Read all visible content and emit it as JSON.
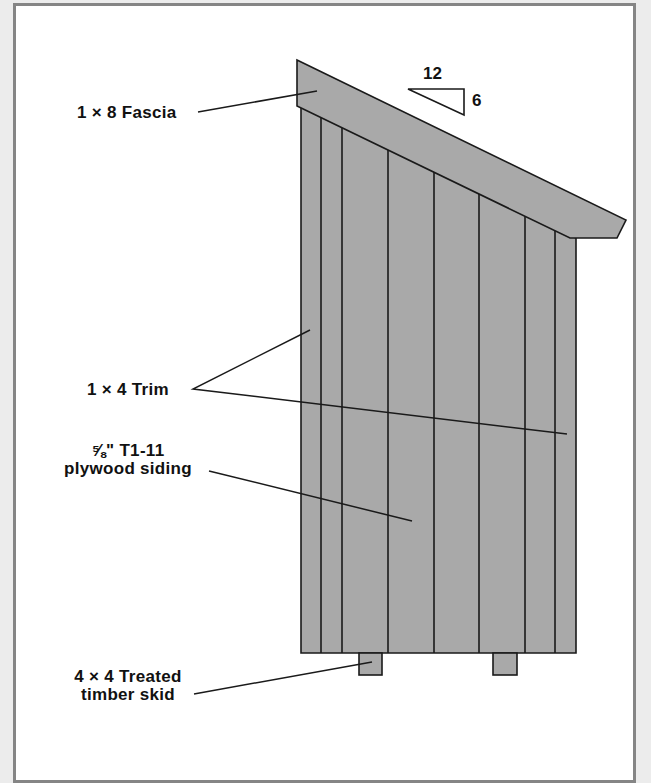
{
  "diagram": {
    "colors": {
      "page_background": "#ececec",
      "frame_border": "#858585",
      "panel_background": "#ffffff",
      "material_fill": "#a9a9a9",
      "line": "#1a1a1a"
    },
    "slope": {
      "run": "12",
      "rise": "6"
    },
    "labels": {
      "fascia": "1 × 8 Fascia",
      "trim": "1 × 4 Trim",
      "siding_line1": "⅝\" T1-11",
      "siding_line2": "plywood siding",
      "skid_line1": "4 × 4 Treated",
      "skid_line2": "timber skid"
    }
  }
}
